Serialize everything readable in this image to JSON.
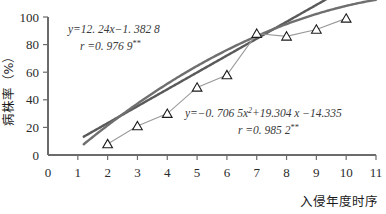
{
  "chart_data": {
    "type": "scatter",
    "title": "",
    "subtitle": "",
    "xlabel": "入侵年度时序",
    "ylabel": "病株率（%）",
    "xlim": [
      0,
      11
    ],
    "ylim": [
      0,
      100
    ],
    "xticks": [
      "0",
      "1",
      "2",
      "3",
      "4",
      "5",
      "6",
      "7",
      "8",
      "9",
      "10",
      "11"
    ],
    "yticks": [
      "0",
      "20",
      "40",
      "60",
      "80",
      "100"
    ],
    "grid": false,
    "legend": "none",
    "marker": "open-triangle",
    "x": [
      2,
      3,
      4,
      5,
      6,
      7,
      8,
      9,
      10
    ],
    "values": [
      8,
      21,
      30,
      49,
      58,
      88,
      86,
      91,
      99
    ],
    "series": [
      {
        "name": "病株率",
        "type": "scatter-line",
        "x": [
          2,
          3,
          4,
          5,
          6,
          7,
          8,
          9,
          10
        ],
        "values": [
          8,
          21,
          30,
          49,
          58,
          88,
          86,
          91,
          99
        ],
        "color": "#9a9a9a",
        "marker": "open-triangle"
      },
      {
        "name": "linear-fit",
        "type": "line",
        "equation": "y=12.24x-1.3828",
        "slope": 12.24,
        "intercept": -1.3828,
        "r": 0.9769,
        "color": "#5a5a5a"
      },
      {
        "name": "quadratic-fit",
        "type": "line",
        "equation": "y=-0.7065x^2+19.304x-14.335",
        "a": -0.7065,
        "b": 19.304,
        "c": -14.335,
        "r": 0.9852,
        "color": "#6f6f6f"
      }
    ],
    "annotations": [
      {
        "id": "linear-equation",
        "line1": "y=12. 24x−1. 382 8",
        "line2_lead": "r =0. 976 9",
        "line2_stars": "**"
      },
      {
        "id": "quadratic-equation",
        "line1_a": "y=−0. 706 5x",
        "line1_sup": "2",
        "line1_b": "+19.304 x −14.335",
        "line2_lead": "r =0. 985 2",
        "line2_stars": "**"
      }
    ]
  },
  "axes": {
    "x_title": "入侵年度时序",
    "y_title": "病株率（%）",
    "x_tick_labels": [
      "0",
      "1",
      "2",
      "3",
      "4",
      "5",
      "6",
      "7",
      "8",
      "9",
      "10",
      "11"
    ],
    "y_tick_labels": [
      "100",
      "80",
      "60",
      "40",
      "20",
      "0"
    ]
  },
  "colors": {
    "axis": "#6b6b6b",
    "data_line": "#a2a2a2",
    "fit_line_1": "#555555",
    "fit_line_2": "#717171",
    "text": "#262626",
    "marker_stroke": "#1d1d1d",
    "background": "#ffffff"
  }
}
